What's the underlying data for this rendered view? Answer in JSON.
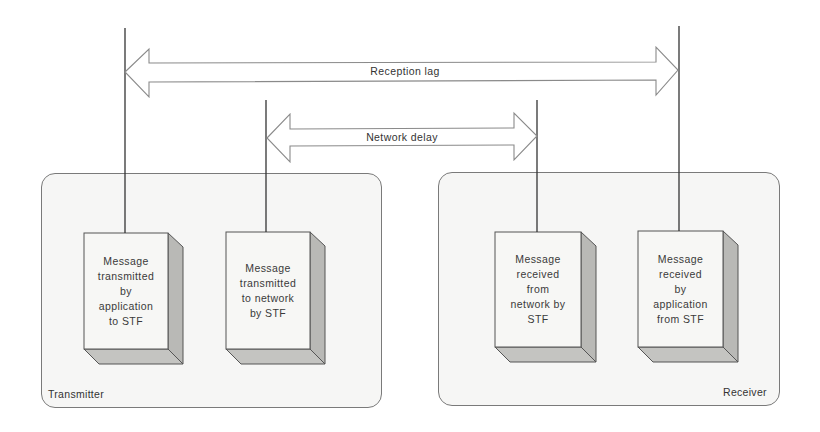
{
  "diagram": {
    "colors": {
      "region_fill": "#f6f6f5",
      "region_border": "#7a7a7a",
      "box_front": "#f7f7f5",
      "box_side": "#b9b9b6",
      "box_bottom": "#c4c4c1",
      "line": "#333333",
      "arrow_fill": "#ffffff",
      "arrow_stroke": "#8a8a8a"
    },
    "regions": [
      {
        "id": "transmitter",
        "label": "Transmitter"
      },
      {
        "id": "receiver",
        "label": "Receiver"
      }
    ],
    "boxes": [
      {
        "id": "tx-app",
        "label": "Message\ntransmitted\nby\napplication\nto STF"
      },
      {
        "id": "tx-net",
        "label": "Message\ntransmitted\nto network\nby STF"
      },
      {
        "id": "rx-net",
        "label": "Message\nreceived\nfrom\nnetwork by\nSTF"
      },
      {
        "id": "rx-app",
        "label": "Message\nreceived\nby\napplication\nfrom STF"
      }
    ],
    "arrows": [
      {
        "id": "reception-lag",
        "label": "Reception lag",
        "from": "tx-app",
        "to": "rx-app"
      },
      {
        "id": "network-delay",
        "label": "Network delay",
        "from": "tx-net",
        "to": "rx-net"
      }
    ]
  }
}
